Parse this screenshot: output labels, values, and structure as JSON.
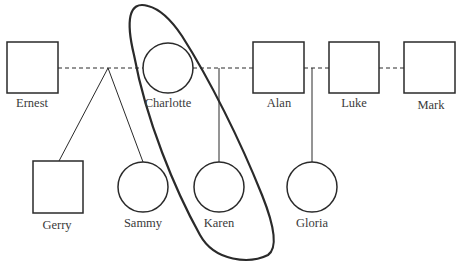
{
  "diagram": {
    "type": "genogram",
    "colors": {
      "stroke": "#2a2a2a",
      "text": "#3a3a3a",
      "background": "#ffffff"
    },
    "people": [
      {
        "id": "ernest",
        "name": "Ernest",
        "sex": "male",
        "shape": "square"
      },
      {
        "id": "charlotte",
        "name": "Charlotte",
        "sex": "female",
        "shape": "circle"
      },
      {
        "id": "alan",
        "name": "Alan",
        "sex": "male",
        "shape": "square"
      },
      {
        "id": "luke",
        "name": "Luke",
        "sex": "male",
        "shape": "square"
      },
      {
        "id": "mark",
        "name": "Mark",
        "sex": "male",
        "shape": "square"
      },
      {
        "id": "gerry",
        "name": "Gerry",
        "sex": "male",
        "shape": "square"
      },
      {
        "id": "sammy",
        "name": "Sammy",
        "sex": "female",
        "shape": "circle"
      },
      {
        "id": "karen",
        "name": "Karen",
        "sex": "female",
        "shape": "circle"
      },
      {
        "id": "gloria",
        "name": "Gloria",
        "sex": "female",
        "shape": "circle"
      }
    ],
    "relationships": [
      {
        "from": "Ernest",
        "to": "Charlotte",
        "style": "dashed"
      },
      {
        "from": "Charlotte",
        "to": "Alan",
        "style": "dashed"
      },
      {
        "from": "Alan",
        "to": "Luke",
        "style": "dashed"
      },
      {
        "from": "Luke",
        "to": "Mark",
        "style": "dashed"
      }
    ],
    "children": [
      {
        "parents": [
          "Ernest",
          "Charlotte"
        ],
        "children": [
          "Gerry",
          "Sammy"
        ]
      },
      {
        "parents": [
          "Charlotte",
          "Alan"
        ],
        "children": [
          "Karen"
        ]
      },
      {
        "parents": [
          "Alan",
          "Luke"
        ],
        "children": [
          "Gloria"
        ]
      }
    ],
    "highlight": {
      "shape": "ellipse-outline",
      "encloses": [
        "Charlotte",
        "Karen"
      ]
    }
  }
}
